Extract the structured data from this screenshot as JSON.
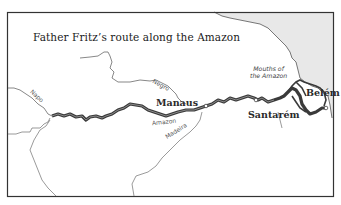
{
  "map": {
    "title": "Father Fritz’s route along the Amazon",
    "colors": {
      "ocean": "#e8e8e8",
      "land": "#ffffff",
      "border": "#333333",
      "route": "#3a3a3a",
      "river": "#555555"
    },
    "cities": [
      {
        "name": "Manaus"
      },
      {
        "name": "Santarém"
      },
      {
        "name": "Belém"
      }
    ],
    "rivers": [
      {
        "name": "Negro"
      },
      {
        "name": "Amazon"
      },
      {
        "name": "Madeira"
      },
      {
        "name": "Napo"
      }
    ],
    "annotations": {
      "mouths_line1": "Mouths of",
      "mouths_line2": "the Amazon"
    }
  }
}
